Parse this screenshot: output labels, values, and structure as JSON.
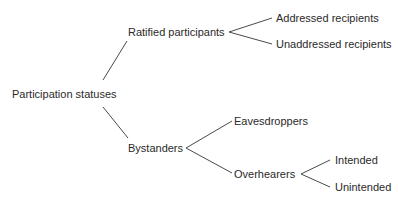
{
  "diagram": {
    "type": "tree",
    "root": {
      "label": "Participation statuses",
      "children": [
        {
          "label": "Ratified participants",
          "children": [
            {
              "label": "Addressed recipients"
            },
            {
              "label": "Unaddressed recipients"
            }
          ]
        },
        {
          "label": "Bystanders",
          "children": [
            {
              "label": "Eavesdroppers"
            },
            {
              "label": "Overhearers",
              "children": [
                {
                  "label": "Intended"
                },
                {
                  "label": "Unintended"
                }
              ]
            }
          ]
        }
      ]
    },
    "colors": {
      "text": "#2a2a2a",
      "line": "#4a4a4a",
      "background": "#ffffff"
    }
  }
}
